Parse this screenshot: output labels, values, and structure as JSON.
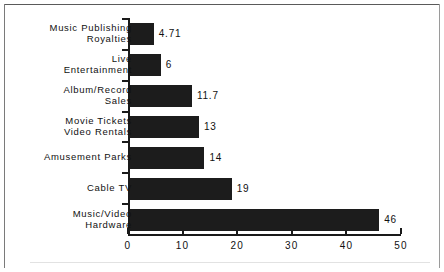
{
  "chart_data": {
    "type": "bar",
    "orientation": "horizontal",
    "title": "",
    "subtitle": "",
    "xlabel": "",
    "ylabel": "",
    "xlim": [
      0,
      50
    ],
    "ylim": null,
    "grid": false,
    "legend": null,
    "xticks": [
      "0",
      "10",
      "20",
      "30",
      "40",
      "50"
    ],
    "xtick_values": [
      0,
      10,
      20,
      30,
      40,
      50
    ],
    "bar_color": "#1c1c1c",
    "axis_color": "#1a1a1a",
    "categories": [
      "Music Publishing\nRoyalties",
      "Live\nEntertainment",
      "Album/Record\nSales",
      "Movie Tickets\nVideo Rentals",
      "Amusement Parks",
      "Cable TV",
      "Music/Video\nHardware"
    ],
    "values": [
      4.71,
      6,
      11.7,
      13,
      14,
      19,
      46
    ],
    "value_labels": [
      "4.71",
      "6",
      "11.7",
      "13",
      "14",
      "19",
      "46"
    ]
  }
}
